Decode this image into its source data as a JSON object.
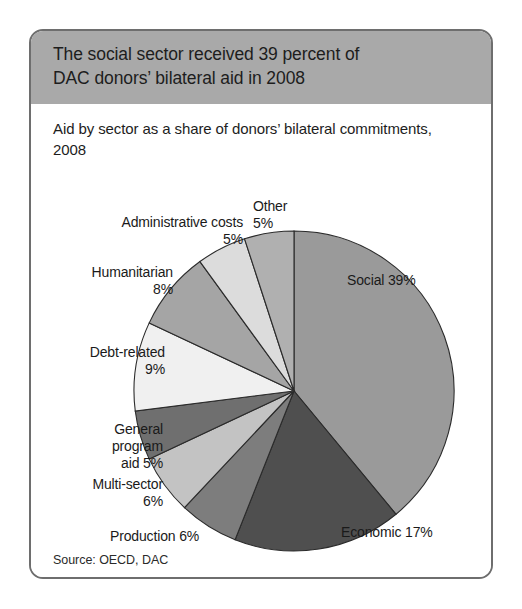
{
  "card": {
    "title_line1": "The social sector received 39 percent of",
    "title_line2": "DAC donors’ bilateral aid in 2008",
    "subtitle": "Aid by sector as a share of donors’ bilateral commitments, 2008",
    "source": "Source: OECD, DAC",
    "header_bg": "#a9a9a9",
    "border_color": "#6e6e6e"
  },
  "chart_data": {
    "type": "pie",
    "title": "The social sector received 39 percent of DAC donors’ bilateral aid in 2008",
    "subtitle": "Aid by sector as a share of donors’ bilateral commitments, 2008",
    "source": "Source: OECD, DAC",
    "unit": "percent",
    "start_angle_deg": 0,
    "direction": "clockwise",
    "legend": "none (direct labels with leader-free placement)",
    "categories": [
      "Social",
      "Economic",
      "Production",
      "Multi-sector",
      "General program aid",
      "Debt-related",
      "Humanitarian",
      "Administrative costs",
      "Other"
    ],
    "values": [
      39,
      17,
      6,
      6,
      5,
      9,
      8,
      5,
      5
    ],
    "slices": [
      {
        "label": "Social",
        "value": 39,
        "display": "Social 39%",
        "color": "#9a9a9a"
      },
      {
        "label": "Economic",
        "value": 17,
        "display": "Economic 17%",
        "color": "#4f4f4f"
      },
      {
        "label": "Production",
        "value": 6,
        "display": "Production 6%",
        "color": "#7d7d7d"
      },
      {
        "label": "Multi-sector",
        "value": 6,
        "display": "Multi-sector\n6%",
        "color": "#c3c3c3"
      },
      {
        "label": "General program aid",
        "value": 5,
        "display": "General\nprogram\naid 5%",
        "color": "#6f6f6f"
      },
      {
        "label": "Debt-related",
        "value": 9,
        "display": "Debt-related\n9%",
        "color": "#f0f0f0"
      },
      {
        "label": "Humanitarian",
        "value": 8,
        "display": "Humanitarian\n8%",
        "color": "#a5a5a5"
      },
      {
        "label": "Administrative costs",
        "value": 5,
        "display": "Administrative costs\n5%",
        "color": "#dcdcdc"
      },
      {
        "label": "Other",
        "value": 5,
        "display": "Other\n5%",
        "color": "#b0b0b0"
      }
    ]
  }
}
